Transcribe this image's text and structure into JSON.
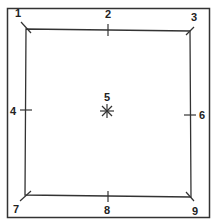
{
  "diagram": {
    "colors": {
      "line": "#333333",
      "background": "#ffffff"
    },
    "points": [
      {
        "id": "1",
        "label": "1",
        "x": 18,
        "y": 13
      },
      {
        "id": "2",
        "label": "2",
        "x": 108,
        "y": 13
      },
      {
        "id": "3",
        "label": "3",
        "x": 194,
        "y": 16
      },
      {
        "id": "4",
        "label": "4",
        "x": 13,
        "y": 110
      },
      {
        "id": "5",
        "label": "5",
        "x": 107,
        "y": 97
      },
      {
        "id": "6",
        "label": "6",
        "x": 202,
        "y": 115
      },
      {
        "id": "7",
        "label": "7",
        "x": 16,
        "y": 208
      },
      {
        "id": "8",
        "label": "8",
        "x": 107,
        "y": 210
      },
      {
        "id": "9",
        "label": "9",
        "x": 195,
        "y": 211
      }
    ]
  }
}
